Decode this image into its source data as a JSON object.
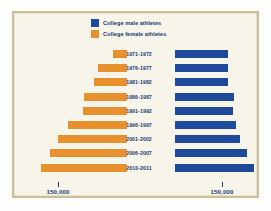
{
  "colors": {
    "male": "#1f4a9b",
    "female": "#e8902e",
    "text": "#1b3a73",
    "background": "#f7f4e9",
    "frame": "#c9c09a"
  },
  "legend": {
    "position": "top-center",
    "entries": [
      {
        "key": "male",
        "label": "College male athletes",
        "color": "#1f4a9b"
      },
      {
        "key": "female",
        "label": "College female athletes",
        "color": "#e8902e"
      }
    ]
  },
  "axis": {
    "left_tick_label": "150,000",
    "right_tick_label": "150,000"
  },
  "chart_data": {
    "type": "bar",
    "subtype": "population-pyramid",
    "orientation": "horizontal",
    "title": "",
    "subtitle": "",
    "xlabel": "",
    "ylabel": "",
    "grid": false,
    "legend_position": "top-center",
    "axis_tick_value": 150000,
    "axis_tick_labels": [
      "150,000",
      "150,000"
    ],
    "categories": [
      "1971-1972",
      "1976-1977",
      "1981-1982",
      "1986-1987",
      "1991-1992",
      "1996-1997",
      "2001-2002",
      "2006-2007",
      "2010-2011"
    ],
    "series": [
      {
        "name": "College female athletes",
        "color": "#e8902e",
        "direction": "left",
        "values": [
          30000,
          62000,
          72000,
          93000,
          96000,
          129000,
          151000,
          167000,
          186000
        ]
      },
      {
        "name": "College male athletes",
        "color": "#1f4a9b",
        "direction": "right",
        "values": [
          170000,
          168000,
          168000,
          190000,
          186000,
          194000,
          208000,
          229000,
          252000
        ]
      }
    ],
    "xlim": [
      0,
      270000
    ]
  },
  "layout": {
    "female_axis_x": 112,
    "male_axis_x": 160,
    "left_tick_x": 43,
    "right_tick_x": 207,
    "px_per_unit_left": 0.00046,
    "px_per_unit_right": 0.000313,
    "row_height": 8,
    "row_pitch": 14.2,
    "plot_top": 36
  }
}
